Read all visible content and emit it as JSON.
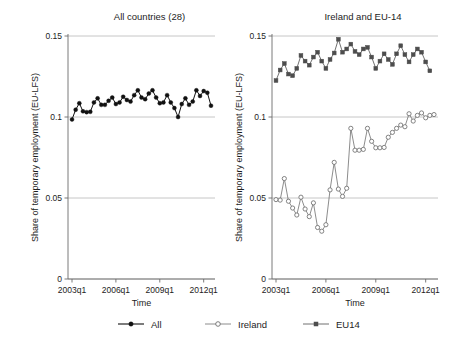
{
  "figure": {
    "ylabel": "Share of temporary employment (EU-LFS)",
    "xlabel": "Time",
    "ytick_labels": [
      "0",
      "0.05",
      "0.1",
      "0.15"
    ],
    "xtick_labels": [
      "2003q1",
      "2006q1",
      "2009q1",
      "2012q1"
    ]
  },
  "legend": {
    "items": [
      {
        "label": "All",
        "marker": "filled-circle",
        "color": "#111111"
      },
      {
        "label": "Ireland",
        "marker": "open-circle",
        "color": "#6e6e6e"
      },
      {
        "label": "EU14",
        "marker": "filled-square",
        "color": "#4d4d4d"
      }
    ]
  },
  "chart_data": [
    {
      "type": "line",
      "title": "All countries (28)",
      "xlabel": "Time",
      "ylabel": "Share of temporary employment (EU-LFS)",
      "ylim": [
        0,
        0.15
      ],
      "yticks": [
        0,
        0.05,
        0.1,
        0.15
      ],
      "xticks": [
        "2003q1",
        "2006q1",
        "2009q1",
        "2012q1"
      ],
      "grid": true,
      "legend_position": "bottom",
      "x": [
        "2003q1",
        "2003q2",
        "2003q3",
        "2003q4",
        "2004q1",
        "2004q2",
        "2004q3",
        "2004q4",
        "2005q1",
        "2005q2",
        "2005q3",
        "2005q4",
        "2006q1",
        "2006q2",
        "2006q3",
        "2006q4",
        "2007q1",
        "2007q2",
        "2007q3",
        "2007q4",
        "2008q1",
        "2008q2",
        "2008q3",
        "2008q4",
        "2009q1",
        "2009q2",
        "2009q3",
        "2009q4",
        "2010q1",
        "2010q2",
        "2010q3",
        "2010q4",
        "2011q1",
        "2011q2",
        "2011q3",
        "2011q4",
        "2012q1"
      ],
      "series": [
        {
          "name": "All",
          "marker": "filled-circle",
          "color": "#111111",
          "values": [
            0.0985,
            0.1045,
            0.1085,
            0.1035,
            0.103,
            0.1032,
            0.109,
            0.1115,
            0.1075,
            0.1075,
            0.11,
            0.112,
            0.108,
            0.109,
            0.1125,
            0.1105,
            0.1095,
            0.1135,
            0.1165,
            0.112,
            0.111,
            0.1145,
            0.1165,
            0.112,
            0.1085,
            0.109,
            0.1135,
            0.109,
            0.1055,
            0.1,
            0.108,
            0.1115,
            0.1075,
            0.1095,
            0.1165,
            0.113,
            0.116,
            0.115,
            0.107
          ]
        }
      ]
    },
    {
      "type": "line",
      "title": "Ireland and EU-14",
      "xlabel": "Time",
      "ylabel": "Share of temporary employment (EU-LFS)",
      "ylim": [
        0,
        0.15
      ],
      "yticks": [
        0,
        0.05,
        0.1,
        0.15
      ],
      "xticks": [
        "2003q1",
        "2006q1",
        "2009q1",
        "2012q1"
      ],
      "grid": true,
      "legend_position": "bottom",
      "x": [
        "2003q1",
        "2003q2",
        "2003q3",
        "2003q4",
        "2004q1",
        "2004q2",
        "2004q3",
        "2004q4",
        "2005q1",
        "2005q2",
        "2005q3",
        "2005q4",
        "2006q1",
        "2006q2",
        "2006q3",
        "2006q4",
        "2007q1",
        "2007q2",
        "2007q3",
        "2007q4",
        "2008q1",
        "2008q2",
        "2008q3",
        "2008q4",
        "2009q1",
        "2009q2",
        "2009q3",
        "2009q4",
        "2010q1",
        "2010q2",
        "2010q3",
        "2010q4",
        "2011q1",
        "2011q2",
        "2011q3",
        "2011q4",
        "2012q1"
      ],
      "series": [
        {
          "name": "Ireland",
          "marker": "open-circle",
          "color": "#6e6e6e",
          "values": [
            0.049,
            0.0487,
            0.062,
            0.048,
            0.0438,
            0.0395,
            0.0505,
            0.0432,
            0.0385,
            0.047,
            0.0318,
            0.0295,
            0.0335,
            0.055,
            0.072,
            0.0555,
            0.051,
            0.056,
            0.093,
            0.0795,
            0.0795,
            0.08,
            0.093,
            0.085,
            0.081,
            0.081,
            0.0812,
            0.0875,
            0.0905,
            0.093,
            0.095,
            0.094,
            0.102,
            0.0975,
            0.101,
            0.1025,
            0.0995,
            0.101,
            0.1015
          ]
        },
        {
          "name": "EU14",
          "marker": "filled-square",
          "color": "#4d4d4d",
          "values": [
            0.1225,
            0.129,
            0.133,
            0.1265,
            0.1255,
            0.13,
            0.138,
            0.1345,
            0.132,
            0.137,
            0.14,
            0.1345,
            0.13,
            0.1355,
            0.1395,
            0.148,
            0.14,
            0.142,
            0.145,
            0.1405,
            0.1385,
            0.142,
            0.143,
            0.137,
            0.13,
            0.1345,
            0.139,
            0.1355,
            0.1325,
            0.139,
            0.144,
            0.1385,
            0.134,
            0.1385,
            0.142,
            0.14,
            0.134,
            0.1285
          ]
        }
      ]
    }
  ]
}
